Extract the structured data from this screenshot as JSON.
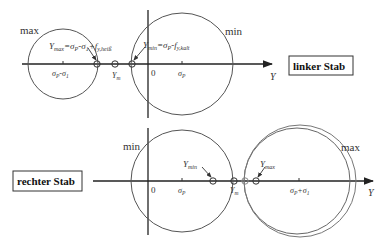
{
  "colors": {
    "line": "#333333",
    "circle": "#555555",
    "background": "#ffffff"
  },
  "top": {
    "box_label": "linker Stab",
    "axis_label": "Y",
    "max_label": "max",
    "min_label": "min",
    "zero_label": "0",
    "sigma_p_label": "σ",
    "sigma_p_sub": "P",
    "left_center_label": "σ",
    "left_center_sub1": "P",
    "left_center_mid": "-σ",
    "left_center_sub2": "1",
    "ym_label": "Y",
    "ym_sub": "m",
    "ymax_main": "Y",
    "ymax_sub": "max",
    "ymax_eq": "=σ",
    "ymax_eq_sub1": "P",
    "ymax_eq_mid": "-σ",
    "ymax_eq_sub2": "1",
    "ymax_eq_plus": "+f",
    "ymax_eq_sub3": "y,heiß",
    "ymin_main": "Y",
    "ymin_sub": "min",
    "ymin_eq": "=σ",
    "ymin_eq_sub1": "P",
    "ymin_eq_mid": "-f",
    "ymin_eq_sub2": "y,kalt"
  },
  "bottom": {
    "box_label": "rechter Stab",
    "axis_label": "Y",
    "max_label": "max",
    "min_label": "min",
    "zero_label": "0",
    "sigma_p_label": "σ",
    "sigma_p_sub": "P",
    "right_center_label": "σ",
    "right_center_sub1": "P",
    "right_center_mid": "+σ",
    "right_center_sub2": "1",
    "ym_label": "Y",
    "ym_sub": "m",
    "ymin_main": "Y",
    "ymin_sub": "min",
    "ymax_main": "Y",
    "ymax_sub": "max"
  }
}
